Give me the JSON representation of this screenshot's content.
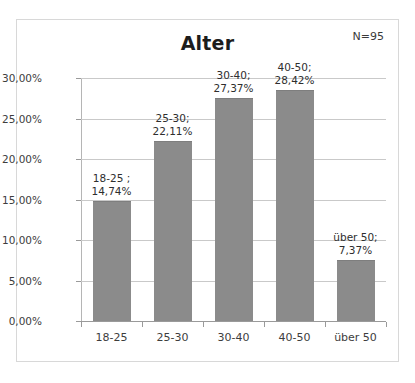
{
  "chart_data": {
    "type": "bar",
    "title": "Alter",
    "annotation": "N=95",
    "xlabel": "",
    "ylabel": "",
    "categories": [
      "18-25",
      "25-30",
      "30-40",
      "40-50",
      "über 50"
    ],
    "values": [
      14.74,
      22.11,
      27.37,
      28.42,
      7.37
    ],
    "value_labels": [
      "14,74%",
      "22,11%",
      "27,37%",
      "28,42%",
      "7,37%"
    ],
    "data_labels": [
      {
        "line1": "18-25 ;",
        "line2": "14,74%"
      },
      {
        "line1": "25-30;",
        "line2": "22,11%"
      },
      {
        "line1": "30-40;",
        "line2": "27,37%"
      },
      {
        "line1": "40-50;",
        "line2": "28,42%"
      },
      {
        "line1": "über 50;",
        "line2": "7,37%"
      }
    ],
    "ylim": [
      0,
      30
    ],
    "ytick_values": [
      0,
      5,
      10,
      15,
      20,
      25,
      30
    ],
    "ytick_labels": [
      "0,00%",
      "5,00%",
      "10,00%",
      "15,00%",
      "20,00%",
      "25,00%",
      "30,00%"
    ],
    "grid": true,
    "legend": false,
    "bar_color": "#8b8b8b",
    "gridline_color": "#c9c9c9",
    "text_color": "#2e2e2e"
  }
}
